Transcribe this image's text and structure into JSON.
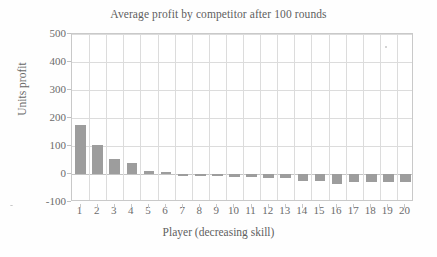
{
  "chart_data": {
    "type": "bar",
    "title": "Average profit by competitor after 100 rounds",
    "xlabel": "Player (decreasing skill)",
    "ylabel": "Units profit",
    "categories": [
      "1",
      "2",
      "3",
      "4",
      "5",
      "6",
      "7",
      "8",
      "9",
      "10",
      "11",
      "12",
      "13",
      "14",
      "15",
      "16",
      "17",
      "18",
      "19",
      "20"
    ],
    "values": [
      175,
      103,
      53,
      40,
      12,
      8,
      -3,
      -3,
      -8,
      -12,
      -12,
      -15,
      -16,
      -24,
      -25,
      -35,
      -28,
      -27,
      -30,
      -28
    ],
    "series": [
      {
        "name": "Average profit",
        "values": [
          175,
          103,
          53,
          40,
          12,
          8,
          -3,
          -3,
          -8,
          -12,
          -12,
          -15,
          -16,
          -24,
          -25,
          -35,
          -28,
          -27,
          -30,
          -28
        ]
      }
    ],
    "ylim": [
      -100,
      500
    ],
    "ytick_labels": [
      "500",
      "400",
      "300",
      "200",
      "100",
      "0",
      "-100"
    ],
    "ytick_values": [
      500,
      400,
      300,
      200,
      100,
      0,
      -100
    ],
    "xtick_labels": [
      "1",
      "2",
      "3",
      "4",
      "5",
      "6",
      "7",
      "8",
      "9",
      "10",
      "11",
      "12",
      "13",
      "14",
      "15",
      "16",
      "17",
      "18",
      "19",
      "20"
    ],
    "grid": true,
    "legend": "none",
    "bar_color": "#9d9d9d",
    "grid_color": "#dcdcdc",
    "axis_color": "#c9c9c9",
    "background_color": "#ffffff",
    "text_color": "#6b6b6b"
  }
}
